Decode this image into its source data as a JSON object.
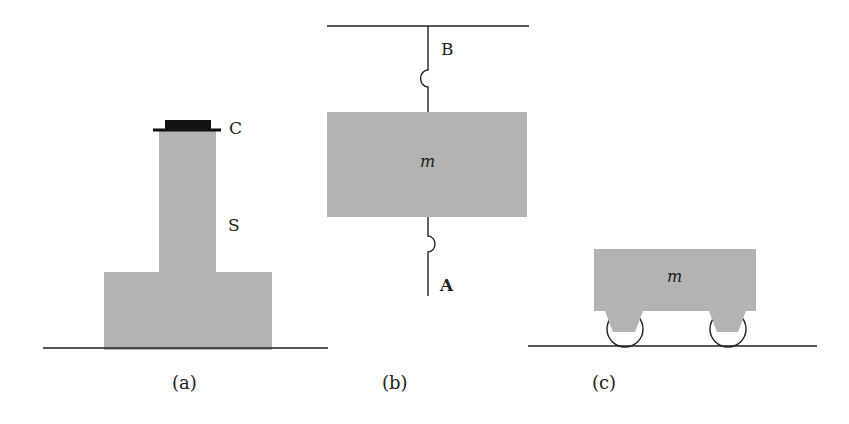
{
  "colors": {
    "body_fill": "#b3b3b3",
    "line": "#222222",
    "cap": "#111111",
    "background": "#ffffff"
  },
  "panel_a": {
    "caption": "(a)",
    "cap_label": "C",
    "stand_label": "S"
  },
  "panel_b": {
    "caption": "(b)",
    "upper_string_label": "B",
    "lower_string_label": "A",
    "mass_label": "m"
  },
  "panel_c": {
    "caption": "(c)",
    "mass_label": "m"
  }
}
